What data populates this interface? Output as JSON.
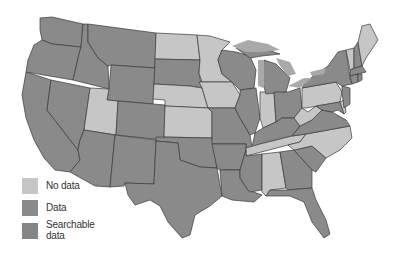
{
  "map": {
    "title": "",
    "region": "United States (contiguous)",
    "colors": {
      "no_data": "#c6c6c6",
      "data": "#8a8a8a",
      "searchable_data": "#858585",
      "border": "#3a3a3a",
      "lake": "#a9a9a9",
      "background": "#ffffff"
    },
    "states_no_data": [
      "ND",
      "MN",
      "NE",
      "KS",
      "IA",
      "UT",
      "IN",
      "PA",
      "WV",
      "TN",
      "NC",
      "AL",
      "ME",
      "VT",
      "DE"
    ],
    "states_data": [
      "WA",
      "OR",
      "CA",
      "ID",
      "NV",
      "MT",
      "WY",
      "CO",
      "AZ",
      "NM",
      "SD",
      "OK",
      "TX",
      "MO",
      "AR",
      "LA",
      "WI",
      "IL",
      "MI",
      "OH",
      "KY",
      "MS",
      "GA",
      "FL",
      "SC",
      "VA",
      "MD",
      "NJ",
      "NY",
      "NH",
      "MA",
      "CT",
      "RI"
    ]
  },
  "legend": {
    "items": [
      {
        "label": "No data",
        "color": "#c6c6c6"
      },
      {
        "label": "Data",
        "color": "#8a8a8a"
      },
      {
        "label": "Searchable",
        "label2": "data",
        "color": "#858585"
      }
    ]
  }
}
